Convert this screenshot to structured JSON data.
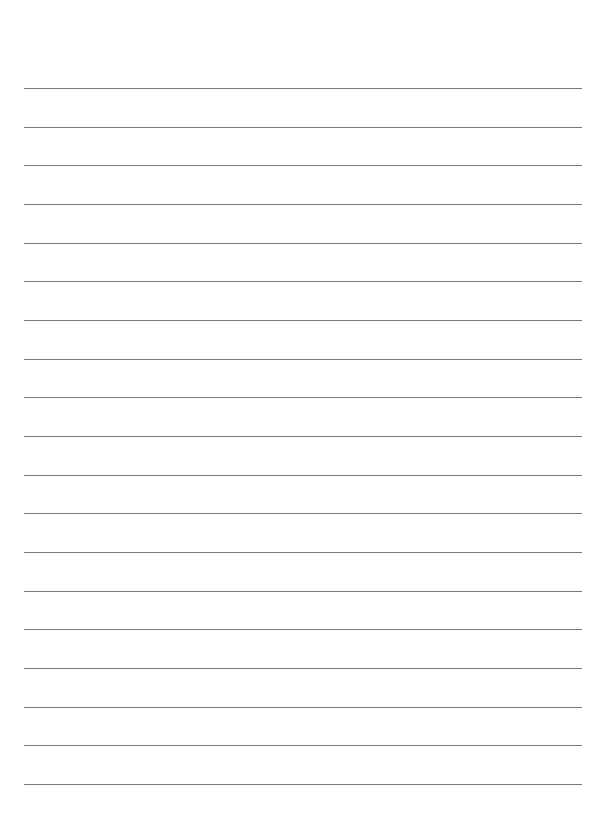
{
  "page": {
    "type": "lined-paper",
    "background": "#ffffff",
    "line_color": "#7a7a7a",
    "line_count": 19,
    "first_line_y": 88,
    "line_spacing": 38.67,
    "line_left": 24,
    "line_width": 558
  }
}
